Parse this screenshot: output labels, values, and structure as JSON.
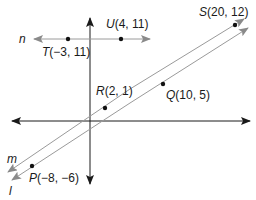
{
  "diagram": {
    "type": "coordinate-geometry",
    "colors": {
      "axis": "#1a1a1a",
      "line": "#9a9a9a",
      "arrow": "#8a8a8a",
      "point": "#111111",
      "text": "#1a1a1a"
    },
    "lines": {
      "n": {
        "name": "n"
      },
      "m": {
        "name": "m"
      },
      "l": {
        "name": "l"
      }
    },
    "points": {
      "T": {
        "name": "T",
        "coords": "(−3, 11)"
      },
      "U": {
        "name": "U",
        "coords": "(4, 11)"
      },
      "R": {
        "name": "R",
        "coords": "(2, 1)"
      },
      "Q": {
        "name": "Q",
        "coords": "(10, 5)"
      },
      "S": {
        "name": "S",
        "coords": "(20, 12)"
      },
      "P": {
        "name": "P",
        "coords": "(−8, −6)"
      }
    }
  }
}
